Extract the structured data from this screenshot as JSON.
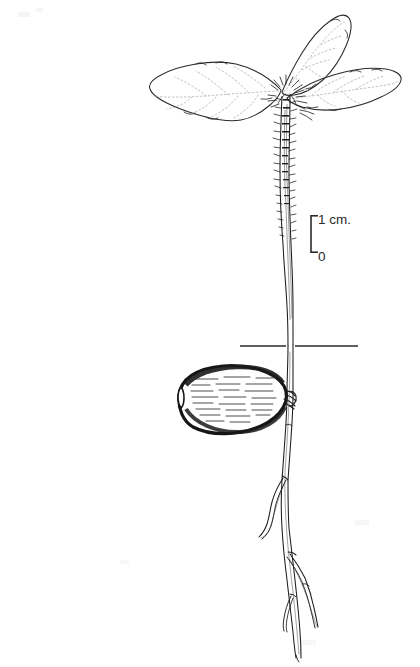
{
  "figure": {
    "name": "oak-seedling-with-acorn",
    "medium": "pen-and-ink line drawing",
    "background_color": "#ffffff",
    "ink_color": "#1d1d1d",
    "vein_color": "#9a9a9a",
    "soil_line_color": "#2a2a2a",
    "caption": ""
  },
  "scale_bar": {
    "name": "scale-bar",
    "top_label": "1 cm.",
    "bottom_label": "0",
    "orientation": "vertical",
    "tick_side": "right",
    "bar_x": 311,
    "top_y": 215,
    "bottom_y": 253,
    "length_px": 38,
    "represents": "1 cm.",
    "color": "#2b2b2b"
  },
  "soil_line": {
    "name": "soil-line",
    "label": "",
    "x_start": 240,
    "x_end": 358,
    "y": 346,
    "color": "#2a2a2a"
  },
  "plant": {
    "common_name": "",
    "parts": [
      {
        "name": "leaf-left",
        "label": "",
        "orientation": "horizontal-left",
        "tip_x": 150,
        "base_x": 282
      },
      {
        "name": "leaf-upper-right",
        "label": "",
        "orientation": "upward-right",
        "tip_x": 348,
        "tip_y": 16
      },
      {
        "name": "leaf-right",
        "label": "",
        "orientation": "horizontal-right",
        "tip_x": 402,
        "tip_y": 72
      },
      {
        "name": "hypocotyl",
        "label": "",
        "surface": "pubescent",
        "top_y": 96,
        "bottom_y": 346
      },
      {
        "name": "acorn",
        "label": "",
        "shape": "ellipse",
        "center_x": 228,
        "center_y": 399,
        "width": 118,
        "height": 66,
        "shading": "horizontal-hatching"
      },
      {
        "name": "taproot",
        "label": "",
        "top_y": 346,
        "tip_y": 658
      },
      {
        "name": "lateral-root-left",
        "label": "",
        "branch_y": 482,
        "tip_x": 262,
        "tip_y": 538
      },
      {
        "name": "lateral-root-right",
        "label": "",
        "branch_y": 556,
        "tip_x": 320,
        "tip_y": 628
      },
      {
        "name": "root-tip-fork",
        "label": "",
        "branch_y": 598,
        "tip_y": 658
      }
    ]
  }
}
